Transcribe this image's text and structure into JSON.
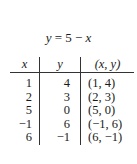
{
  "title": {
    "lhs": "y",
    "eq": " = 5 − ",
    "rhs": "x"
  },
  "table": {
    "headers": [
      "x",
      "y",
      "(x, y)"
    ],
    "rows": [
      {
        "x": "1",
        "y": "4",
        "pair": "(1, 4)"
      },
      {
        "x": "2",
        "y": "3",
        "pair": "(2, 3)"
      },
      {
        "x": "5",
        "y": "0",
        "pair": "(5, 0)"
      },
      {
        "x": "−1",
        "y": "6",
        "pair": "(−1, 6)"
      },
      {
        "x": "6",
        "y": "−1",
        "pair": "(6, −1)"
      }
    ]
  }
}
